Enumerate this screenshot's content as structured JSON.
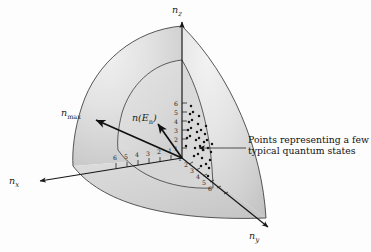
{
  "figure": {
    "background_color": "#fdfdfd",
    "ink_color": "#1c1c1c"
  },
  "axes": [
    {
      "name": "n-z-axis",
      "label": "n",
      "subscript": "z",
      "direction": "up"
    },
    {
      "name": "n-x-axis",
      "label": "n",
      "subscript": "x",
      "direction": "down-left"
    },
    {
      "name": "n-y-axis",
      "label": "n",
      "subscript": "y",
      "direction": "down-right"
    }
  ],
  "vectors": [
    {
      "name": "n-max-vector",
      "label": "n",
      "subscript": "max"
    },
    {
      "name": "n-of-E-vector",
      "label": "n(E",
      "subscript": "n",
      "label_end": ")"
    }
  ],
  "tick_labels": {
    "z_axis": [
      "6",
      "5",
      "4",
      "3",
      "2",
      "1"
    ],
    "x_axis": [
      "6",
      "5",
      "4",
      "3",
      "2",
      "1"
    ],
    "y_axis": [
      "1",
      "2",
      "3",
      "4",
      "5",
      "6"
    ]
  },
  "annotation": {
    "line1": "Points representing a few",
    "line2": "typical quantum states"
  },
  "colors": {
    "shell_light": "#e9e9e9",
    "shell_mid": "#d4d4d4",
    "shell_dark": "#bdbdbd",
    "inner_fill": "#dcdcdc",
    "floor_fill": "#d0d0d0",
    "outline": "#3a3a3a",
    "dot_color": "#141414"
  },
  "lattice_dots": {
    "description": "grid of quantum state points inside inner shell",
    "count": 34
  }
}
